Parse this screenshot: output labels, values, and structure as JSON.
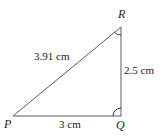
{
  "diagram": {
    "type": "right-triangle",
    "vertices": {
      "P": {
        "label": "P"
      },
      "Q": {
        "label": "Q"
      },
      "R": {
        "label": "R"
      }
    },
    "sides": {
      "PR": {
        "label": "3.91 cm",
        "length_cm": 3.91
      },
      "QR": {
        "label": "2.5 cm",
        "length_cm": 2.5
      },
      "PQ": {
        "label": "3 cm",
        "length_cm": 3
      }
    },
    "marked_angles": [
      "R",
      "Q"
    ]
  }
}
